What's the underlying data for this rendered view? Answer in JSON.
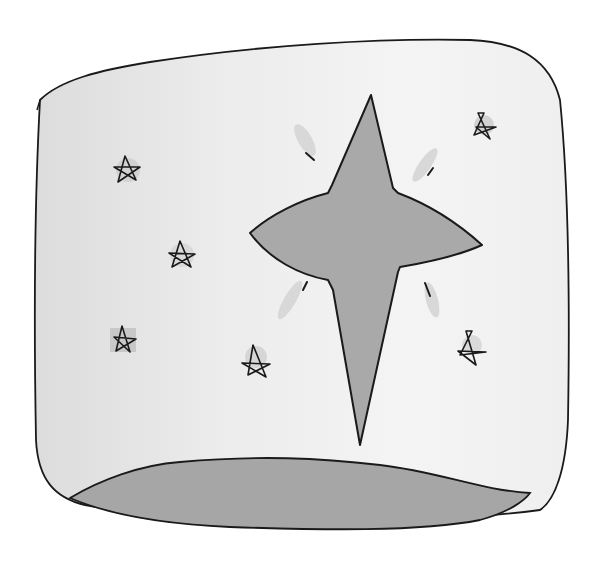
{
  "illustration": {
    "subject": "Hand-drawn watercolor and ink illustration of a large four-pointed star in a night sky with small five-pointed stars and a curved hill at the bottom",
    "style": "ink outline with grey watercolor wash",
    "colors": {
      "paper": "#ffffff",
      "sky_wash": "#e8e8e8",
      "star_fill": "#a8a8a8",
      "hill_fill": "#a4a4a4",
      "sparkle_wash": "#d6d6d6",
      "ink": "#1a1a1a"
    },
    "elements": {
      "frame": "rounded square sky panel",
      "big_star": "four-pointed star with rays",
      "small_stars_count": 7,
      "hill": "grey curved ground at bottom"
    }
  }
}
